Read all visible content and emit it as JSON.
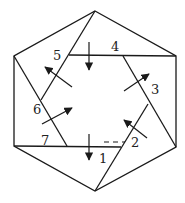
{
  "diagram": {
    "title": "",
    "stroke_color": "#1a1a1a",
    "outer_hexagon": [
      [
        95,
        11
      ],
      [
        176,
        56
      ],
      [
        176,
        147
      ],
      [
        95,
        191
      ],
      [
        14,
        146
      ],
      [
        14,
        56
      ]
    ],
    "segments": [
      {
        "id": "top-left-diag",
        "from": [
          95,
          11
        ],
        "to": [
          41,
          100
        ]
      },
      {
        "id": "top-line-4",
        "from": [
          69,
          55
        ],
        "to": [
          176,
          56
        ]
      },
      {
        "id": "right-diag-3",
        "from": [
          123,
          56
        ],
        "to": [
          176,
          147
        ]
      },
      {
        "id": "bottom-right-diag-2",
        "from": [
          148,
          104
        ],
        "to": [
          95,
          191
        ]
      },
      {
        "id": "bottom-line-1-7",
        "from": [
          14,
          146
        ],
        "to": [
          121,
          147
        ]
      },
      {
        "id": "left-diag-6",
        "from": [
          14,
          56
        ],
        "to": [
          67,
          146
        ]
      }
    ],
    "dashed_segment": {
      "from": [
        104,
        142
      ],
      "to": [
        125,
        142
      ]
    },
    "labels": [
      {
        "text": "1",
        "x": 99,
        "y": 163
      },
      {
        "text": "2",
        "x": 131,
        "y": 147
      },
      {
        "text": "3",
        "x": 151,
        "y": 94
      },
      {
        "text": "4",
        "x": 111,
        "y": 51
      },
      {
        "text": "5",
        "x": 53,
        "y": 60
      },
      {
        "text": "6",
        "x": 33,
        "y": 114
      },
      {
        "text": "7",
        "x": 41,
        "y": 145
      }
    ],
    "arrows": [
      {
        "id": "arrow-top-down",
        "from": [
          89,
          42
        ],
        "to": [
          89,
          70
        ]
      },
      {
        "id": "arrow-bottom-down",
        "from": [
          89,
          134
        ],
        "to": [
          89,
          160
        ]
      },
      {
        "id": "arrow-upper-left",
        "from": [
          72,
          87
        ],
        "to": [
          45,
          67
        ]
      },
      {
        "id": "arrow-lower-left",
        "from": [
          42,
          124
        ],
        "to": [
          72,
          108
        ]
      },
      {
        "id": "arrow-upper-right",
        "from": [
          124,
          91
        ],
        "to": [
          149,
          74
        ]
      },
      {
        "id": "arrow-lower-right",
        "from": [
          147,
          138
        ],
        "to": [
          124,
          120
        ]
      }
    ]
  }
}
